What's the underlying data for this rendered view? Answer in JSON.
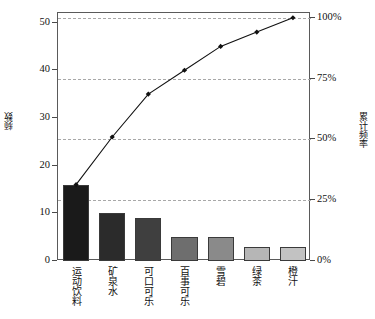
{
  "chart_data": {
    "type": "bar",
    "title": "",
    "subtitle": "",
    "xlabel": "",
    "ylabel": "频数",
    "ylabel_secondary": "累计频率",
    "categories": [
      "运动饮料",
      "矿泉水",
      "可口可乐",
      "百事可乐",
      "雪碧",
      "绿茶",
      "橙汁"
    ],
    "series": [
      {
        "name": "频数",
        "type": "bar",
        "axis": "left",
        "values": [
          16,
          10,
          9,
          5,
          5,
          3,
          3
        ],
        "colors": [
          "#1a1a1a",
          "#2b2b2b",
          "#3f3f3f",
          "#6e6e6e",
          "#8a8a8a",
          "#b6b6b6",
          "#c2c2c2"
        ]
      },
      {
        "name": "累计频率",
        "type": "line",
        "axis": "right",
        "values": [
          16,
          26,
          35,
          40,
          45,
          48,
          51
        ],
        "percents": [
          "31.4%",
          "51.0%",
          "68.6%",
          "78.4%",
          "88.2%",
          "94.1%",
          "100%"
        ],
        "color": "#111111",
        "marker": "diamond"
      }
    ],
    "total": 51,
    "ylim": [
      0,
      52
    ],
    "ylim_secondary": [
      0,
      100
    ],
    "yticks": [
      0,
      10,
      20,
      30,
      40,
      50
    ],
    "yticks_secondary": [
      0,
      25,
      50,
      75,
      100
    ],
    "ytick_labels": [
      "0",
      "10",
      "20",
      "30",
      "40",
      "50"
    ],
    "ytick_labels_secondary": [
      "0%",
      "25%",
      "50%",
      "75%",
      "100%"
    ],
    "grid": true,
    "grid_axis": "secondary",
    "legend": false,
    "legend_position": "none"
  }
}
